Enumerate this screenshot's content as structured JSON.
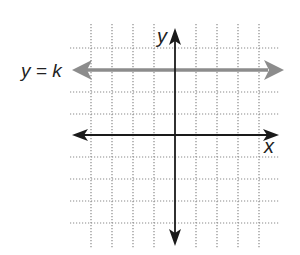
{
  "diagram": {
    "labels": {
      "line_equation": "y = k",
      "y_axis": "y",
      "x_axis": "x"
    },
    "grid": {
      "style": "dotted",
      "columns": 10,
      "rows": 10,
      "cell_size_px": 21
    },
    "axes": {
      "x_axis_row_from_top": 5,
      "y_axis_column_from_left": 5,
      "arrows": "both ends"
    },
    "lines": [
      {
        "name": "y = k",
        "type": "horizontal",
        "grid_row_from_top": 2,
        "arrows": "both ends",
        "color": "#8c8c8c"
      }
    ],
    "colors": {
      "axis": "#1a1a1a",
      "grid": "#8a8a8a",
      "highlight_line": "#8c8c8c",
      "text": "#222222"
    }
  }
}
